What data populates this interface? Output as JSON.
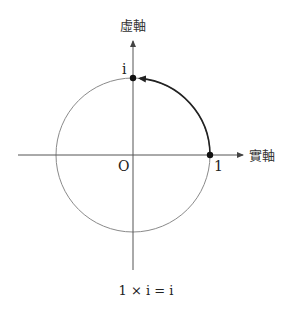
{
  "diagram": {
    "type": "complex-plane-rotation",
    "labels": {
      "imag_axis": "虛軸",
      "real_axis": "實軸",
      "origin": "O",
      "one": "1",
      "i": "i",
      "caption": "1 × i = i"
    },
    "geometry": {
      "center": [
        133,
        155
      ],
      "radius": 77
    },
    "colors": {
      "axis": "#555555",
      "circle": "#888888",
      "arc": "#222222",
      "point": "#111111"
    }
  }
}
